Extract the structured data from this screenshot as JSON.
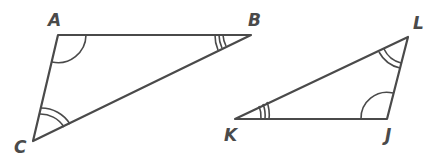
{
  "diagram": {
    "type": "similar-triangles",
    "stroke_color": "#4a4a4a",
    "triangles": [
      {
        "name": "ABC",
        "vertices": [
          {
            "label": "A",
            "x": 58,
            "y": 35,
            "angle_marks": 1
          },
          {
            "label": "B",
            "x": 251,
            "y": 35,
            "angle_marks": 3
          },
          {
            "label": "C",
            "x": 33,
            "y": 141,
            "angle_marks": 2
          }
        ]
      },
      {
        "name": "LJK",
        "vertices": [
          {
            "label": "L",
            "x": 408,
            "y": 37,
            "angle_marks": 2
          },
          {
            "label": "J",
            "x": 387,
            "y": 119,
            "angle_marks": 1
          },
          {
            "label": "K",
            "x": 235,
            "y": 119,
            "angle_marks": 3
          }
        ]
      }
    ],
    "labels": {
      "A": "A",
      "B": "B",
      "C": "C",
      "L": "L",
      "K": "K",
      "J": "J"
    }
  }
}
